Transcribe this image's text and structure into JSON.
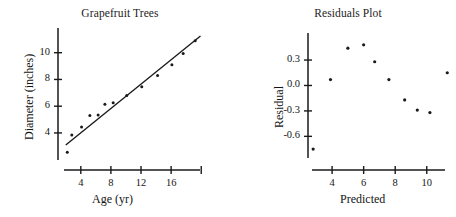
{
  "figure": {
    "background_color": "#ffffff",
    "ink_color": "#1a1a1a",
    "width": 456,
    "height": 217
  },
  "chart_data": [
    {
      "id": "grapefruit-scatter",
      "type": "scatter",
      "title": "Grapefruit Trees",
      "xlabel": "Age  (yr)",
      "ylabel": "Diameter (inches)",
      "xlim": [
        1.5,
        20.5
      ],
      "ylim": [
        2.2,
        11.4
      ],
      "xticks": [
        4,
        8,
        12,
        16,
        20
      ],
      "xtick_labels": [
        "4",
        "8",
        "12",
        "16",
        ""
      ],
      "yticks": [
        4,
        6,
        8,
        10
      ],
      "ytick_labels": [
        "4",
        "6",
        "8",
        "10"
      ],
      "grid": false,
      "legend": "none",
      "x": [
        2.2,
        2.8,
        4.1,
        5.2,
        6.3,
        7.2,
        8.3,
        10.1,
        12.1,
        14.2,
        16.1,
        17.6,
        19.2
      ],
      "y": [
        2.55,
        3.85,
        4.45,
        5.3,
        5.35,
        6.15,
        6.25,
        6.8,
        7.45,
        8.3,
        9.1,
        9.95,
        10.9
      ],
      "fit_line": {
        "label": "least-squares regression line",
        "x_start": 2.0,
        "y_start": 3.1,
        "x_end": 19.9,
        "y_end": 11.25
      }
    },
    {
      "id": "residuals-scatter",
      "type": "scatter",
      "title": "Residuals Plot",
      "xlabel": "Predicted",
      "ylabel": "Residual",
      "xlim": [
        2.6,
        11.6
      ],
      "ylim": [
        -0.82,
        0.56
      ],
      "xticks": [
        4,
        6,
        8,
        10
      ],
      "xtick_labels": [
        "4",
        "6",
        "8",
        "10"
      ],
      "yticks": [
        0.3,
        0.0,
        -0.3,
        -0.6
      ],
      "ytick_labels": [
        "0.3",
        "0.0",
        "-0.3",
        "-0.6"
      ],
      "grid": false,
      "legend": "none",
      "x": [
        2.8,
        3.9,
        5.0,
        6.0,
        6.7,
        7.6,
        8.6,
        9.4,
        10.2,
        11.3
      ],
      "y": [
        -0.75,
        0.07,
        0.44,
        0.48,
        0.28,
        0.07,
        -0.17,
        -0.29,
        -0.32,
        0.15
      ]
    }
  ]
}
